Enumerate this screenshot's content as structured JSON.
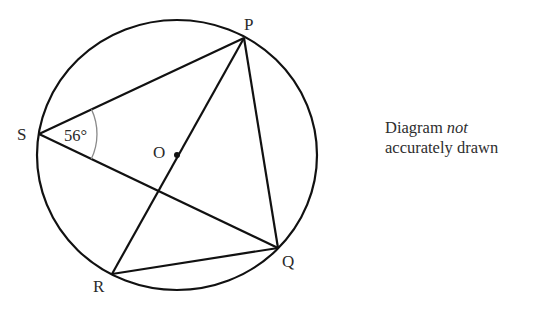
{
  "diagram": {
    "type": "circle-geometry",
    "circle": {
      "center_label": "O",
      "cx": 177,
      "cy": 155,
      "rx": 140,
      "ry": 135
    },
    "points": {
      "P": {
        "label": "P",
        "x": 244,
        "y": 38
      },
      "Q": {
        "label": "Q",
        "x": 278,
        "y": 248
      },
      "R": {
        "label": "R",
        "x": 112,
        "y": 274
      },
      "S": {
        "label": "S",
        "x": 39,
        "y": 134
      },
      "O": {
        "label": "O",
        "x": 177,
        "y": 155
      }
    },
    "segments": [
      "SP",
      "SQ",
      "PR",
      "PQ",
      "RQ"
    ],
    "angle": {
      "vertex": "S",
      "between": [
        "SP",
        "SQ"
      ],
      "value": "56°"
    },
    "colors": {
      "line": "#111111",
      "arc": "#8a8a8a",
      "text": "#2a2a2a"
    }
  },
  "note": {
    "line1_regular": "Diagram ",
    "line1_italic": "not",
    "line2": "accurately drawn"
  }
}
